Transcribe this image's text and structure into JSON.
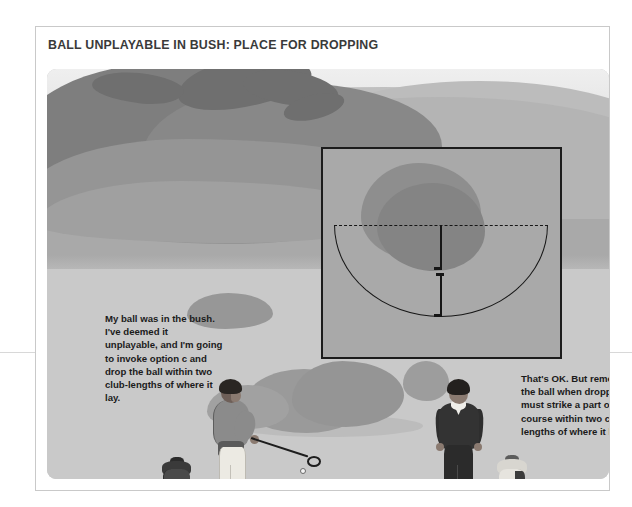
{
  "page": {
    "title": "BALL UNPLAYABLE IN BUSH: PLACE FOR DROPPING",
    "background_color": "#ffffff",
    "border_color": "#c9c9c9"
  },
  "illustration": {
    "alt_name": "golf-course-scene",
    "palette": {
      "sky": "#ebebeb",
      "distant_hill": "#c0c0c0",
      "mid_hill": "#b4b4b4",
      "far_fairway": "#a9a9a9",
      "near_fairway": "#c9c9c9",
      "tree_dark": "#7e7e7e",
      "bush": "#9a9a9a",
      "inset_fill": "#a9a9a9",
      "line_black": "#161616"
    }
  },
  "inset_diagram": {
    "name": "plan-view-drop-zone",
    "elements": {
      "bush_label": "bush",
      "dashed_line_label": "reference line through ball position",
      "arc_label": "two club-lengths semicircle",
      "radius_label": "two club-lengths radius"
    }
  },
  "speech": {
    "left": "My ball was in the bush. I've deemed it unplayable, and I'm going to invoke option c and drop the ball within two club-lengths of where it lay.",
    "right": "That's OK. But remember the ball when dropped must strike a part of the course within two club-lengths of where it lay."
  },
  "figures": {
    "left_golfer": "golfer-with-club",
    "left_bag": "dark-golf-bag",
    "right_golfer": "golfer-observing",
    "right_bag": "light-golf-bag",
    "ball": "golf-ball"
  }
}
